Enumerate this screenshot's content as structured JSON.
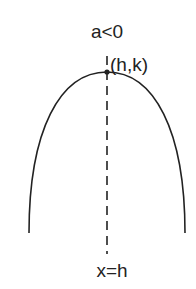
{
  "diagram": {
    "title_label": "a<0",
    "vertex_label": "(h,k)",
    "axis_label": "x=h",
    "colors": {
      "curve": "#222222",
      "axis": "#222222",
      "text": "#222222",
      "background": "#ffffff"
    }
  }
}
